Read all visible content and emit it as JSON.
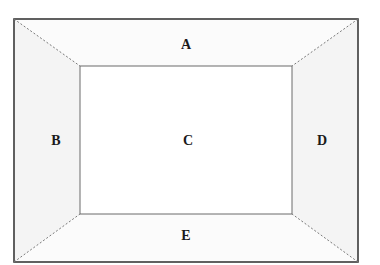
{
  "diagram": {
    "type": "frustum-top-view",
    "regions": [
      {
        "id": "A",
        "label": "A",
        "position": "top"
      },
      {
        "id": "B",
        "label": "B",
        "position": "left"
      },
      {
        "id": "C",
        "label": "C",
        "position": "center"
      },
      {
        "id": "D",
        "label": "D",
        "position": "right"
      },
      {
        "id": "E",
        "label": "E",
        "position": "bottom"
      }
    ],
    "colors": {
      "outer_border": "#3a3a3a",
      "inner_border": "#6a6a6a",
      "diagonal": "#7a7a7a",
      "side_fill": "#f5f5f5",
      "label": "#1a1a1a"
    }
  }
}
